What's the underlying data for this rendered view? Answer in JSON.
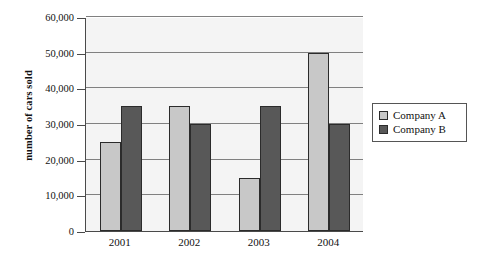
{
  "chart_data": {
    "type": "bar",
    "title": "",
    "subtitle": "",
    "xlabel": "",
    "ylabel": "number of cars sold",
    "categories": [
      "2001",
      "2002",
      "2003",
      "2004"
    ],
    "series": [
      {
        "name": "Company A",
        "values": [
          25000,
          35000,
          15000,
          50000
        ],
        "color": "#c8c8c8"
      },
      {
        "name": "Company B",
        "values": [
          35000,
          30000,
          35000,
          30000
        ],
        "color": "#585858"
      }
    ],
    "ylim": [
      0,
      60000
    ],
    "ytick_values": [
      0,
      10000,
      20000,
      30000,
      40000,
      50000,
      60000
    ],
    "ytick_labels": [
      "0",
      "10,000",
      "20,000",
      "30,000",
      "40,000",
      "50,000",
      "60,000"
    ],
    "grid": true,
    "grid_axis": "y",
    "legend_position": "right",
    "annotations": []
  },
  "legend": {
    "entries": [
      {
        "label": "Company A",
        "swatch_name": "legend-swatch-company-a"
      },
      {
        "label": "Company B",
        "swatch_name": "legend-swatch-company-b"
      }
    ]
  },
  "colors": {
    "series_a": "#c8c8c8",
    "series_b": "#585858",
    "plot_background": "#f4f4f4",
    "gridline": "#808080",
    "axis": "#4a4a4a",
    "bar_border": "#2b2b2b",
    "text": "#111111"
  }
}
